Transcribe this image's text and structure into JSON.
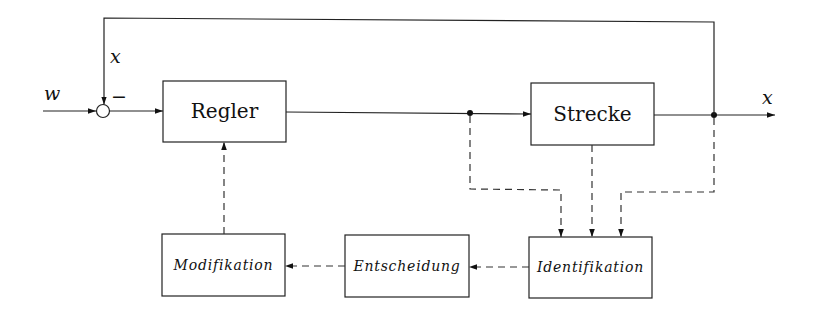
{
  "signals": {
    "reference": "w",
    "feedback": "x",
    "minus_sign": "−",
    "output": "x"
  },
  "blocks": {
    "controller": "Regler",
    "plant": "Strecke",
    "identification": "Identifikation",
    "decision": "Entscheidung",
    "modification": "Modifikation"
  },
  "connections": [
    {
      "from": "w",
      "to": "summing-junction",
      "style": "solid"
    },
    {
      "from": "summing-junction",
      "to": "Regler",
      "style": "solid"
    },
    {
      "from": "Regler",
      "to": "Strecke",
      "style": "solid"
    },
    {
      "from": "Strecke",
      "to": "x",
      "style": "solid"
    },
    {
      "from": "x",
      "to": "summing-junction",
      "style": "solid",
      "sign": "-"
    },
    {
      "from": "Regler-output",
      "to": "Identifikation",
      "style": "dashed"
    },
    {
      "from": "Strecke",
      "to": "Identifikation",
      "style": "dashed"
    },
    {
      "from": "x",
      "to": "Identifikation",
      "style": "dashed"
    },
    {
      "from": "Identifikation",
      "to": "Entscheidung",
      "style": "dashed"
    },
    {
      "from": "Entscheidung",
      "to": "Modifikation",
      "style": "dashed"
    },
    {
      "from": "Modifikation",
      "to": "Regler",
      "style": "dashed"
    }
  ]
}
